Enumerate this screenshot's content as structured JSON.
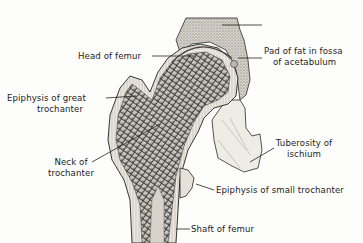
{
  "figure": {
    "labels": {
      "head_of_femur": "Head of femur",
      "pad_of_fat": [
        "Pad of fat in fossa",
        "of acetabulum"
      ],
      "epiphysis_great_trochanter": [
        "Epiphysis of great",
        "trochanter"
      ],
      "neck_of_trochanter": [
        "Neck of",
        "trochanter"
      ],
      "tuberosity_of_ischium": [
        "Tuberosity of",
        "ischium"
      ],
      "epiphysis_small_trochanter": "Epiphysis of small trochanter",
      "shaft_of_femur": "Shaft of femur"
    },
    "colors": {
      "ink": "#1e1e1e",
      "bone_fill": "#e9e6df",
      "spongy_bone": "#5a5a5a",
      "cartilage": "#d4d1ca"
    }
  }
}
